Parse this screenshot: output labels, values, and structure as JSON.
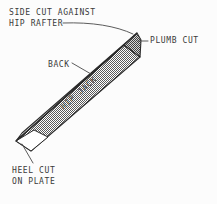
{
  "figure": {
    "background_color": "#fcfcfc",
    "ink_color": "#3a3a3a"
  },
  "labels": {
    "side_cut": {
      "line1": "SIDE CUT AGAINST",
      "line2": "HIP RAFTER"
    },
    "plumb_cut": "PLUMB CUT",
    "back": "BACK",
    "hip_jack": "HIP JACK",
    "heel_cut": {
      "line1": "HEEL CUT",
      "line2": "ON PLATE"
    }
  },
  "geometry": {
    "beam_description": "Long slender rafter drawn in oblique projection running from a sharp heel point at lower-left up to a squared plumb-cut end at upper-right.",
    "top_face_color": "#ffffff",
    "side_face_fill": "#8e8e8e",
    "end_face_fill": "#6f6f6f",
    "outline_color": "#2b2b2b",
    "heel_point": [
      16,
      141
    ],
    "plumb_end_top": [
      137,
      33
    ],
    "plumb_end_bottom": [
      140,
      57
    ]
  },
  "leaders": [
    {
      "name": "side-cut-leader",
      "from_label": "HIP RAFTER",
      "to_feature": "top-right side cut"
    },
    {
      "name": "plumb-cut-leader",
      "from_label": "PLUMB CUT",
      "to_feature": "right end face"
    },
    {
      "name": "back-leader",
      "from_label": "BACK",
      "to_feature": "upper white face of rafter"
    },
    {
      "name": "heel-cut-leader",
      "from_label": "HEEL CUT ON PLATE",
      "to_feature": "lower-left point of rafter"
    }
  ]
}
